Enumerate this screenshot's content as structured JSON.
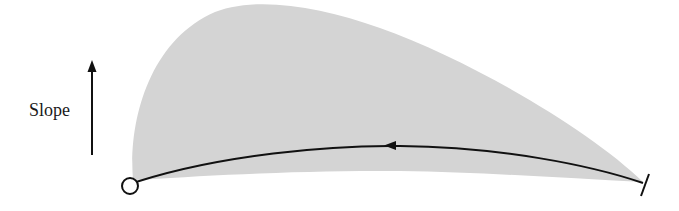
{
  "diagram": {
    "axis_label": "Slope",
    "colors": {
      "region_fill": "#d4d4d4",
      "line": "#111111",
      "background": "#ffffff"
    },
    "elements": {
      "arrow": "upward-arrow",
      "start_marker": "open-circle",
      "end_marker": "tick-bar",
      "path_direction": "right-to-left"
    }
  }
}
